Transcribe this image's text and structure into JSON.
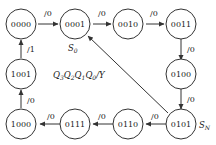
{
  "diagram": {
    "legend": "Q3Q2Q1Q0/Y",
    "legend_parts": {
      "q3": "Q",
      "s3": "3",
      "q2": "Q",
      "s2": "2",
      "q1": "Q",
      "s1": "1",
      "q0": "Q",
      "s0": "0",
      "tail": "/Y"
    },
    "markers": {
      "s0": {
        "main": "S",
        "sub": "0"
      },
      "sn": {
        "main": "S",
        "sub": "N"
      }
    },
    "states": [
      {
        "id": "0000",
        "label": "0000"
      },
      {
        "id": "0001",
        "label": "0001"
      },
      {
        "id": "0010",
        "label": "0010"
      },
      {
        "id": "0011",
        "label": "0011"
      },
      {
        "id": "0100",
        "label": "0100"
      },
      {
        "id": "0101",
        "label": "0101"
      },
      {
        "id": "0110",
        "label": "0110"
      },
      {
        "id": "0111",
        "label": "0111"
      },
      {
        "id": "1000",
        "label": "1000"
      },
      {
        "id": "1001",
        "label": "1001"
      }
    ],
    "transitions": [
      {
        "from": "0000",
        "to": "0001",
        "label": "/0"
      },
      {
        "from": "0001",
        "to": "0010",
        "label": "/0"
      },
      {
        "from": "0010",
        "to": "0011",
        "label": "/0"
      },
      {
        "from": "0011",
        "to": "0100",
        "label": "/0"
      },
      {
        "from": "0100",
        "to": "0101",
        "label": "/0"
      },
      {
        "from": "0101",
        "to": "0110",
        "label": "/0"
      },
      {
        "from": "0110",
        "to": "0111",
        "label": "/0"
      },
      {
        "from": "0111",
        "to": "1000",
        "label": "/0"
      },
      {
        "from": "1000",
        "to": "1001",
        "label": "/0"
      },
      {
        "from": "1001",
        "to": "0000",
        "label": "/1"
      },
      {
        "from": "0101",
        "to": "0001",
        "label": ""
      }
    ]
  }
}
